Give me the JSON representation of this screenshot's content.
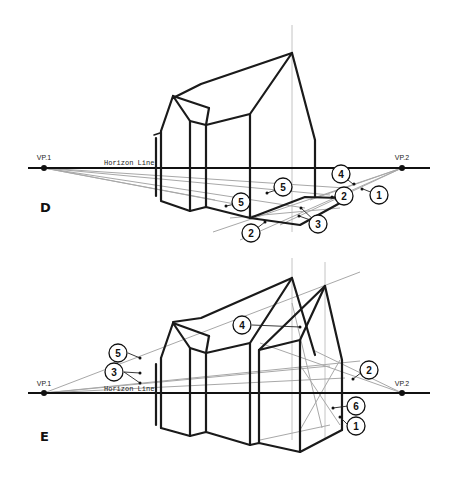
{
  "figure": {
    "panels": [
      {
        "id": "D",
        "mark": "D",
        "horizon_label": "Horizon Line",
        "vp1_label": "VP.1",
        "vp2_label": "VP.2",
        "callouts": [
          {
            "n": "1",
            "label": "1"
          },
          {
            "n": "2",
            "label": "2"
          },
          {
            "n": "2b",
            "label": "2"
          },
          {
            "n": "3",
            "label": "3"
          },
          {
            "n": "4",
            "label": "4"
          },
          {
            "n": "5",
            "label": "5"
          },
          {
            "n": "5b",
            "label": "5"
          }
        ]
      },
      {
        "id": "E",
        "mark": "E",
        "horizon_label": "Horizon Line",
        "vp1_label": "VP.1",
        "vp2_label": "VP.2",
        "callouts": [
          {
            "n": "1",
            "label": "1"
          },
          {
            "n": "2",
            "label": "2"
          },
          {
            "n": "3",
            "label": "3"
          },
          {
            "n": "4",
            "label": "4"
          },
          {
            "n": "5",
            "label": "5"
          },
          {
            "n": "6",
            "label": "6"
          }
        ]
      }
    ]
  },
  "colors": {
    "ink": "#1a1a1a",
    "guide": "#a8a8a8",
    "background": "#ffffff"
  }
}
